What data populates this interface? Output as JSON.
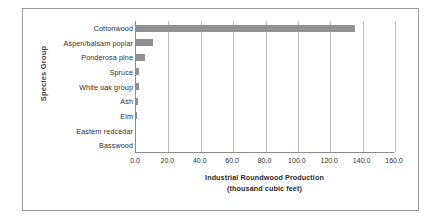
{
  "chart_data": {
    "type": "bar",
    "orientation": "horizontal",
    "title": "",
    "xlabel": "Industrial Roundwood Production (thousand cubic feet)",
    "xlabel_line1": "Industrial Roundwood Production",
    "xlabel_line2": "(thousand cubic feet)",
    "ylabel": "Species Group",
    "categories": [
      "Cottonwood",
      "Aspen/balsam poplar",
      "Ponderosa pine",
      "Spruce",
      "White oak group",
      "Ash",
      "Elm",
      "Eastern redcedar",
      "Basswood"
    ],
    "values": [
      135.0,
      10.5,
      5.5,
      2.0,
      2.0,
      1.5,
      0.3,
      0.0,
      0.0
    ],
    "xlim": [
      0.0,
      160.0
    ],
    "xticks": [
      0.0,
      20.0,
      40.0,
      60.0,
      80.0,
      100.0,
      120.0,
      140.0,
      160.0
    ],
    "xtick_labels": [
      "0.0",
      "20.0",
      "40.0",
      "60.0",
      "80.0",
      "100.0",
      "120.0",
      "140.0",
      "160.0"
    ],
    "grid": "vertical",
    "legend": "none",
    "bar_color": "#919191",
    "gridline_color": "#bfbfbf",
    "axis_color": "#8c8c8c",
    "frame_color": "#9a9a9a",
    "background_color": "#ffffff"
  }
}
